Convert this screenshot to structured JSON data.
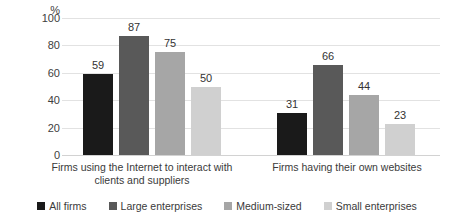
{
  "chart_data": {
    "type": "bar",
    "title": "",
    "xlabel": "",
    "ylabel": "%",
    "unit_label": "%",
    "ylim": [
      0,
      100
    ],
    "yticks": [
      100,
      80,
      60,
      40,
      20,
      0
    ],
    "grid": true,
    "legend_position": "bottom",
    "categories": [
      "Firms using the Internet to interact with clients and suppliers",
      "Firms having their own websites"
    ],
    "category_lines": [
      [
        "Firms using the Internet to interact with",
        "clients and suppliers"
      ],
      [
        "Firms having their own websites"
      ]
    ],
    "series": [
      {
        "name": "All firms",
        "color": "#1a1a1a",
        "values": [
          59,
          31
        ]
      },
      {
        "name": "Large enterprises",
        "color": "#595959",
        "values": [
          87,
          66
        ]
      },
      {
        "name": "Medium-sized",
        "color": "#a6a6a6",
        "values": [
          75,
          44
        ]
      },
      {
        "name": "Small enterprises",
        "color": "#d0d0d0",
        "values": [
          50,
          23
        ]
      }
    ]
  }
}
